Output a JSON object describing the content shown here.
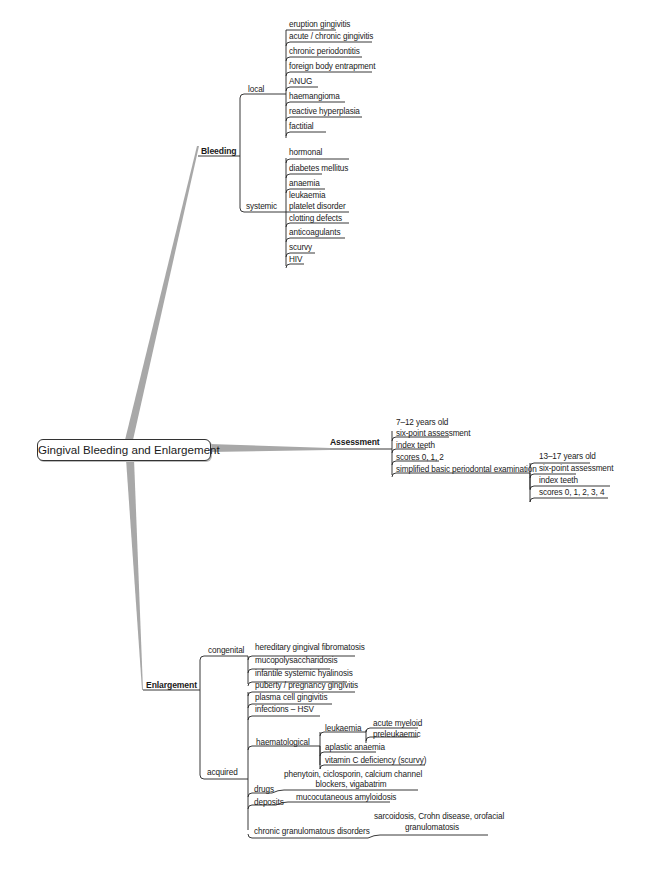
{
  "root": {
    "label": "Gingival Bleeding and Enlargement"
  },
  "branches": {
    "bleeding": {
      "label": "Bleeding",
      "local": {
        "label": "local",
        "items": [
          "eruption gingivitis",
          "acute / chronic gingivitis",
          "chronic periodontitis",
          "foreign body entrapment",
          "ANUG",
          "haemangioma",
          "reactive hyperplasia",
          "factitial"
        ]
      },
      "systemic": {
        "label": "systemic",
        "items": [
          "hormonal",
          "diabetes mellitus",
          "anaemia",
          "leukaemia",
          "platelet disorder",
          "clotting defects",
          "anticoagulants",
          "scurvy",
          "HIV"
        ]
      }
    },
    "assessment": {
      "label": "Assessment",
      "items": [
        "7–12 years old",
        "six-point assessment",
        "index teeth",
        "scores 0, 1, 2",
        "simplified basic periodontal examination"
      ],
      "sub": {
        "items": [
          "13–17 years old",
          "six-point assessment",
          "index teeth",
          "scores 0, 1, 2, 3, 4"
        ]
      }
    },
    "enlargement": {
      "label": "Enlargement",
      "congenital": {
        "label": "congenital",
        "items": [
          "hereditary gingival fibromatosis",
          "mucopolysaccharidosis",
          "infantile systemic hyalinosis"
        ]
      },
      "acquired": {
        "label": "acquired",
        "items": [
          "puberty / pregnancy gingivitis",
          "plasma cell gingivitis",
          "infections – HSV"
        ],
        "haematological": {
          "label": "haematological",
          "leukaemia": {
            "label": "leukaemia",
            "items": [
              "acute myeloid",
              "preleukaemic"
            ]
          },
          "items": [
            "aplastic anaemia",
            "vitamin C deficiency (scurvy)"
          ]
        },
        "drugs": {
          "label": "drugs",
          "item_line1": "phenytoin, ciclosporin, calcium channel",
          "item_line2": "blockers, vigabatrim"
        },
        "deposits": {
          "label": "deposits",
          "item": "mucocutaneous amyloidosis"
        },
        "chronic": {
          "label": "chronic granulomatous disorders",
          "item_line1": "sarcoidosis, Crohn disease, orofacial",
          "item_line2": "granulomatosis"
        }
      }
    }
  },
  "colors": {
    "branch": "#a8a8a8",
    "line": "#222222"
  }
}
